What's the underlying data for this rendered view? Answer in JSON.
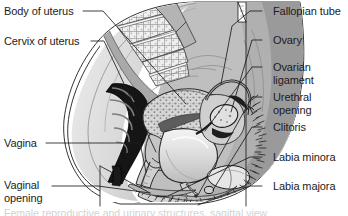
{
  "figure": {
    "width": 348,
    "height": 216,
    "background_color": "#ffffff",
    "line_color": "#1c1c1c",
    "text_color": "#1c1c1c",
    "caption_text": "Female reproductive and urinary structures, sagittal view",
    "labels_left": [
      {
        "id": "body-of-uterus",
        "text": "Body of uterus",
        "x": 4,
        "y": 6
      },
      {
        "id": "cervix-of-uterus",
        "text": "Cervix of uterus",
        "x": 4,
        "y": 36
      },
      {
        "id": "vagina",
        "text": "Vagina",
        "x": 4,
        "y": 138
      },
      {
        "id": "vaginal-opening",
        "text": "Vaginal opening",
        "x": 4,
        "y": 180
      }
    ],
    "labels_right": [
      {
        "id": "fallopian-tube",
        "text": "Fallopian tube",
        "x": 273,
        "y": 6
      },
      {
        "id": "ovary",
        "text": "Ovary",
        "x": 273,
        "y": 35
      },
      {
        "id": "ovarian-ligament",
        "text": "Ovarian ligament",
        "x": 273,
        "y": 62
      },
      {
        "id": "urethral-opening",
        "text": "Urethral opening",
        "x": 273,
        "y": 92
      },
      {
        "id": "clitoris",
        "text": "Clitoris",
        "x": 273,
        "y": 122
      },
      {
        "id": "labia-minora",
        "text": "Labia minora",
        "x": 273,
        "y": 152
      },
      {
        "id": "labia-majora",
        "text": "Labia majora",
        "x": 273,
        "y": 181
      }
    ],
    "palette": {
      "outline": "#1c1c1c",
      "skin_light": "#e3e3e3",
      "tissue_mid": "#bdbdbd",
      "tissue_dark": "#8f8f8f",
      "muscle_gray": "#a5a5a5",
      "cavity_black": "#151515",
      "bone_light": "#efefef",
      "bladder_fill": "#d9d9d9",
      "white": "#ffffff"
    }
  }
}
